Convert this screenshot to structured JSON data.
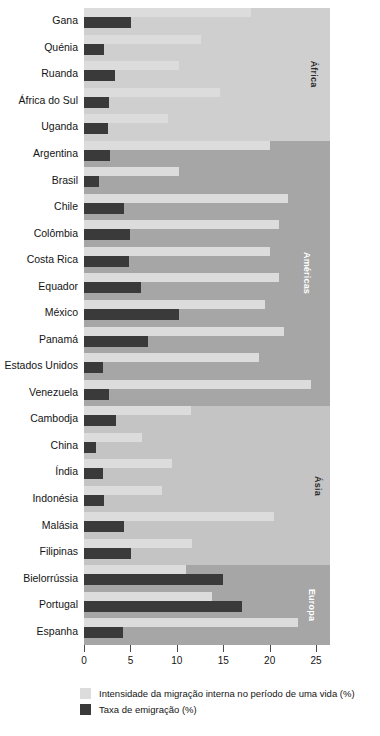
{
  "chart_data": {
    "type": "bar",
    "orientation": "horizontal",
    "title": "",
    "xlabel": "",
    "ylabel": "",
    "xlim": [
      0,
      26.5
    ],
    "xticks": [
      0,
      5,
      10,
      15,
      20,
      25
    ],
    "xtick_labels": [
      "0",
      "5",
      "10",
      "15",
      "20",
      "25"
    ],
    "grid": false,
    "legend_position": "bottom-left",
    "series": [
      {
        "name": "Intensidade da migração interna no período de uma vida (%)",
        "key": "internal",
        "color": "#dcdcdc"
      },
      {
        "name": "Taxa de emigração (%)",
        "key": "emigration",
        "color": "#3a3a3a"
      }
    ],
    "categories": [
      "Gana",
      "Quénia",
      "Ruanda",
      "África do Sul",
      "Uganda",
      "Argentina",
      "Brasil",
      "Chile",
      "Colômbia",
      "Costa Rica",
      "Equador",
      "México",
      "Panamá",
      "Estados Unidos",
      "Venezuela",
      "Cambodja",
      "China",
      "Índia",
      "Indonésia",
      "Malásia",
      "Filipinas",
      "Bielorrússia",
      "Portugal",
      "Espanha"
    ],
    "groups": [
      {
        "label": "África",
        "band_color": "#cfcfcf",
        "label_color": "dark",
        "rows": [
          {
            "category": "Gana",
            "internal": 18.0,
            "emigration": 5.1
          },
          {
            "category": "Quénia",
            "internal": 12.6,
            "emigration": 2.2
          },
          {
            "category": "Ruanda",
            "internal": 10.2,
            "emigration": 3.3
          },
          {
            "category": "África do Sul",
            "internal": 14.7,
            "emigration": 2.7
          },
          {
            "category": "Uganda",
            "internal": 9.0,
            "emigration": 2.6
          }
        ]
      },
      {
        "label": "Américas",
        "band_color": "#a6a6a6",
        "label_color": "light",
        "rows": [
          {
            "category": "Argentina",
            "internal": 20.0,
            "emigration": 2.8
          },
          {
            "category": "Brasil",
            "internal": 10.2,
            "emigration": 1.6
          },
          {
            "category": "Chile",
            "internal": 22.0,
            "emigration": 4.3
          },
          {
            "category": "Colômbia",
            "internal": 21.0,
            "emigration": 5.0
          },
          {
            "category": "Costa Rica",
            "internal": 20.0,
            "emigration": 4.9
          },
          {
            "category": "Equador",
            "internal": 21.0,
            "emigration": 6.1
          },
          {
            "category": "México",
            "internal": 19.5,
            "emigration": 10.2
          },
          {
            "category": "Panamá",
            "internal": 21.5,
            "emigration": 6.9
          },
          {
            "category": "Estados Unidos",
            "internal": 18.8,
            "emigration": 2.0
          },
          {
            "category": "Venezuela",
            "internal": 24.5,
            "emigration": 2.7
          }
        ]
      },
      {
        "label": "Ásia",
        "band_color": "#c4c4c4",
        "label_color": "dark",
        "rows": [
          {
            "category": "Cambodja",
            "internal": 11.5,
            "emigration": 3.5
          },
          {
            "category": "China",
            "internal": 6.3,
            "emigration": 1.3
          },
          {
            "category": "Índia",
            "internal": 9.5,
            "emigration": 2.0
          },
          {
            "category": "Indonésia",
            "internal": 8.4,
            "emigration": 2.2
          },
          {
            "category": "Malásia",
            "internal": 20.5,
            "emigration": 4.3
          },
          {
            "category": "Filipinas",
            "internal": 11.6,
            "emigration": 5.1
          }
        ]
      },
      {
        "label": "Europa",
        "band_color": "#a6a6a6",
        "label_color": "light",
        "rows": [
          {
            "category": "Bielorrússia",
            "internal": 11.0,
            "emigration": 15.0
          },
          {
            "category": "Portugal",
            "internal": 13.8,
            "emigration": 17.0
          },
          {
            "category": "Espanha",
            "internal": 23.0,
            "emigration": 4.2
          }
        ]
      }
    ],
    "legend": [
      {
        "label": "Intensidade da migração interna no período de uma vida (%)",
        "color": "#dcdcdc"
      },
      {
        "label": "Taxa de emigração (%)",
        "color": "#3a3a3a"
      }
    ]
  }
}
